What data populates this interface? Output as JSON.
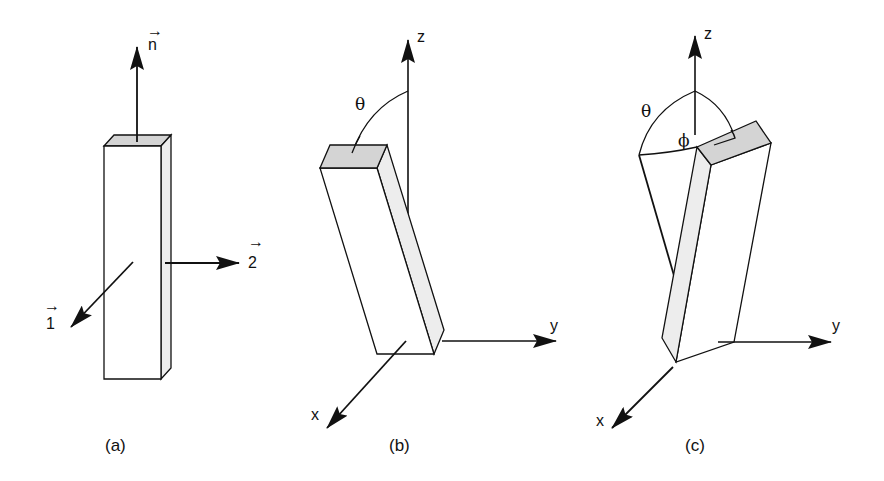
{
  "figure": {
    "panels": [
      {
        "id": "a",
        "caption": "(a)",
        "vectors": {
          "normal": "n",
          "axis1": "1",
          "axis2": "2"
        },
        "vector_arrow_glyph": "→"
      },
      {
        "id": "b",
        "caption": "(b)",
        "axes": {
          "x": "x",
          "y": "y",
          "z": "z"
        },
        "angles": {
          "polar": "θ"
        }
      },
      {
        "id": "c",
        "caption": "(c)",
        "axes": {
          "x": "x",
          "y": "y",
          "z": "z"
        },
        "angles": {
          "polar": "θ",
          "azimuth": "ϕ"
        }
      }
    ],
    "colors": {
      "line": "#111111",
      "top_face_fill": "#d4d4d4",
      "side_face_fill": "#ededed",
      "front_face_fill": "#ffffff"
    }
  }
}
